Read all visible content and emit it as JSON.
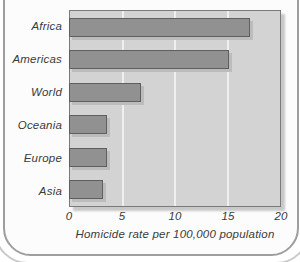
{
  "chart_data": {
    "type": "bar",
    "orientation": "horizontal",
    "categories": [
      "Africa",
      "Americas",
      "World",
      "Oceania",
      "Europe",
      "Asia"
    ],
    "values": [
      17.2,
      15.2,
      6.9,
      3.6,
      3.6,
      3.2
    ],
    "title": "",
    "xlabel": "Homicide rate per 100,000 population",
    "ylabel": "",
    "xlim": [
      0,
      20
    ],
    "xticks": [
      0,
      5,
      10,
      15,
      20
    ],
    "grid": "vertical gridlines at 5, 10, 15",
    "legend": "none",
    "colors": {
      "bar_fill": "#919191",
      "bar_border": "#5f5f5f",
      "bar_shadow": "#bcbcbc",
      "plot_background": "#d3d3d3",
      "plot_border": "#7a7a7a",
      "gridline": "#eff0ee",
      "card_background": "#fcfcfc",
      "card_border": "#9e9e9e",
      "text": "#3b3b3b"
    }
  }
}
